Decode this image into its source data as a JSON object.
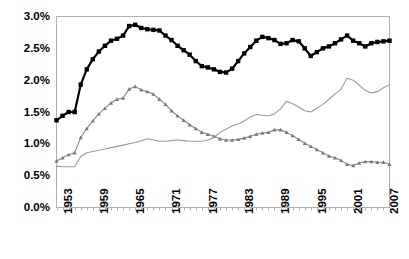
{
  "chart_data": {
    "type": "line",
    "title": "",
    "subtitle": "",
    "xlabel": "",
    "ylabel": "",
    "xlim": [
      1953,
      2008
    ],
    "ylim": [
      0.0,
      3.0
    ],
    "ytick_values": [
      0.0,
      0.5,
      1.0,
      1.5,
      2.0,
      2.5,
      3.0
    ],
    "ytick_labels": [
      "0.0%",
      "0.5%",
      "1.0%",
      "1.5%",
      "2.0%",
      "2.5%",
      "3.0%"
    ],
    "xtick_values": [
      1953,
      1959,
      1965,
      1971,
      1977,
      1983,
      1989,
      1995,
      2001,
      2007
    ],
    "xtick_labels": [
      "1953",
      "1959",
      "1965",
      "1971",
      "1977",
      "1983",
      "1989",
      "1995",
      "2001",
      "2007"
    ],
    "grid": false,
    "legend": "none",
    "value_unit": "percent",
    "x": [
      1953,
      1954,
      1955,
      1956,
      1957,
      1958,
      1959,
      1960,
      1961,
      1962,
      1963,
      1964,
      1965,
      1966,
      1967,
      1968,
      1969,
      1970,
      1971,
      1972,
      1973,
      1974,
      1975,
      1976,
      1977,
      1978,
      1979,
      1980,
      1981,
      1982,
      1983,
      1984,
      1985,
      1986,
      1987,
      1988,
      1989,
      1990,
      1991,
      1992,
      1993,
      1994,
      1995,
      1996,
      1997,
      1998,
      1999,
      2000,
      2001,
      2002,
      2003,
      2004,
      2005,
      2006,
      2007,
      2008
    ],
    "series": [
      {
        "name": "total",
        "marker": "square",
        "color": "#000000",
        "line_color": "#000000",
        "line_width": 2.2,
        "marker_size": 4.4,
        "values": [
          1.37,
          1.44,
          1.5,
          1.5,
          1.93,
          2.17,
          2.33,
          2.45,
          2.54,
          2.62,
          2.65,
          2.7,
          2.85,
          2.87,
          2.82,
          2.8,
          2.79,
          2.78,
          2.7,
          2.63,
          2.54,
          2.47,
          2.4,
          2.3,
          2.22,
          2.2,
          2.17,
          2.13,
          2.12,
          2.18,
          2.3,
          2.42,
          2.52,
          2.62,
          2.68,
          2.66,
          2.63,
          2.57,
          2.58,
          2.63,
          2.61,
          2.5,
          2.38,
          2.44,
          2.5,
          2.53,
          2.58,
          2.64,
          2.7,
          2.62,
          2.58,
          2.53,
          2.58,
          2.6,
          2.61,
          2.62
        ]
      },
      {
        "name": "defense",
        "marker": "triangle",
        "color": "#777777",
        "line_color": "#888888",
        "line_width": 1.1,
        "marker_size": 4.0,
        "values": [
          0.73,
          0.78,
          0.83,
          0.86,
          1.1,
          1.24,
          1.36,
          1.47,
          1.56,
          1.64,
          1.7,
          1.72,
          1.86,
          1.9,
          1.85,
          1.82,
          1.78,
          1.7,
          1.62,
          1.52,
          1.44,
          1.37,
          1.3,
          1.24,
          1.18,
          1.15,
          1.12,
          1.08,
          1.06,
          1.06,
          1.07,
          1.09,
          1.12,
          1.15,
          1.17,
          1.18,
          1.22,
          1.22,
          1.18,
          1.13,
          1.07,
          1.01,
          0.96,
          0.91,
          0.86,
          0.81,
          0.78,
          0.74,
          0.68,
          0.66,
          0.7,
          0.72,
          0.72,
          0.71,
          0.71,
          0.68
        ]
      },
      {
        "name": "nondefense",
        "marker": "none",
        "color": "#999999",
        "line_color": "#999999",
        "line_width": 1.1,
        "marker_size": 0,
        "values": [
          0.65,
          0.64,
          0.64,
          0.64,
          0.8,
          0.86,
          0.88,
          0.9,
          0.92,
          0.94,
          0.96,
          0.98,
          1.0,
          1.02,
          1.05,
          1.08,
          1.06,
          1.04,
          1.04,
          1.05,
          1.06,
          1.05,
          1.04,
          1.04,
          1.04,
          1.06,
          1.1,
          1.18,
          1.23,
          1.28,
          1.31,
          1.36,
          1.42,
          1.46,
          1.45,
          1.44,
          1.47,
          1.55,
          1.67,
          1.63,
          1.58,
          1.52,
          1.5,
          1.56,
          1.62,
          1.7,
          1.78,
          1.86,
          2.03,
          2.0,
          1.92,
          1.84,
          1.8,
          1.82,
          1.88,
          1.93
        ]
      }
    ]
  },
  "axes": {
    "frame_color": "#b0b0b0",
    "tick_color": "#b0b0b0",
    "label_color": "#000000"
  }
}
